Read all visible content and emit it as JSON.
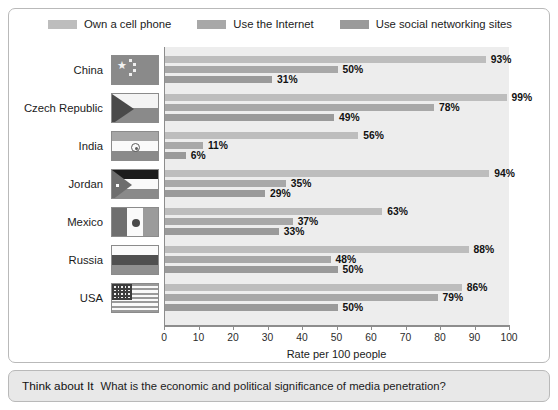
{
  "legend": {
    "items": [
      {
        "label": "Own a cell phone",
        "color": "#bdbdbd",
        "key": "cell"
      },
      {
        "label": "Use the Internet",
        "color": "#a8a8a8",
        "key": "internet"
      },
      {
        "label": "Use social networking sites",
        "color": "#9a9a9a",
        "key": "social"
      }
    ]
  },
  "chart_data": {
    "type": "bar",
    "orientation": "horizontal",
    "title": "",
    "xlabel": "Rate per 100 people",
    "ylabel": "",
    "xlim": [
      0,
      100
    ],
    "xticks": [
      "0",
      "10",
      "20",
      "30",
      "40",
      "50",
      "60",
      "70",
      "80",
      "90",
      "100"
    ],
    "grid": false,
    "legend_position": "top",
    "categories": [
      "China",
      "Czech Republic",
      "India",
      "Jordan",
      "Mexico",
      "Russia",
      "USA"
    ],
    "series": [
      {
        "name": "Own a cell phone",
        "color": "#bdbdbd",
        "values": [
          93,
          99,
          56,
          94,
          63,
          88,
          86
        ]
      },
      {
        "name": "Use the Internet",
        "color": "#a8a8a8",
        "values": [
          50,
          78,
          11,
          35,
          37,
          48,
          79
        ]
      },
      {
        "name": "Use social networking sites",
        "color": "#9a9a9a",
        "values": [
          31,
          49,
          6,
          29,
          33,
          50,
          50
        ]
      }
    ],
    "value_labels": [
      [
        "93%",
        "50%",
        "31%"
      ],
      [
        "99%",
        "78%",
        "49%"
      ],
      [
        "56%",
        "11%",
        "6%"
      ],
      [
        "94%",
        "35%",
        "29%"
      ],
      [
        "63%",
        "37%",
        "33%"
      ],
      [
        "88%",
        "48%",
        "50%"
      ],
      [
        "86%",
        "79%",
        "50%"
      ]
    ]
  },
  "flags": [
    {
      "country": "China",
      "name": "flag-china"
    },
    {
      "country": "Czech Republic",
      "name": "flag-czech-republic"
    },
    {
      "country": "India",
      "name": "flag-india"
    },
    {
      "country": "Jordan",
      "name": "flag-jordan"
    },
    {
      "country": "Mexico",
      "name": "flag-mexico"
    },
    {
      "country": "Russia",
      "name": "flag-russia"
    },
    {
      "country": "USA",
      "name": "flag-usa"
    }
  ],
  "caption": {
    "lead": "Think about It",
    "text": "What is the economic and political significance of media penetration?"
  }
}
